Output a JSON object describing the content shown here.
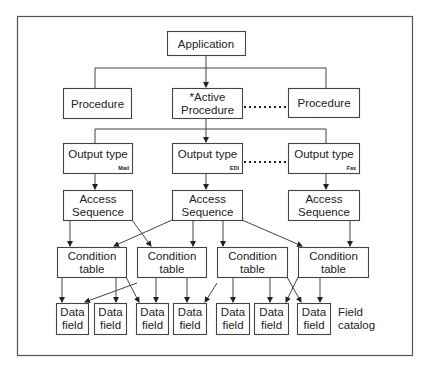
{
  "diagram": {
    "application": "Application",
    "procedures": [
      {
        "lines": [
          "Procedure"
        ]
      },
      {
        "lines": [
          "*Active",
          "Procedure"
        ]
      },
      {
        "lines": [
          "Procedure"
        ]
      }
    ],
    "output_types": [
      {
        "label": "Output type",
        "medium": "Mail"
      },
      {
        "label": "Output type",
        "medium": "EDI"
      },
      {
        "label": "Output type",
        "medium": "Fax"
      }
    ],
    "access_sequences": [
      {
        "lines": [
          "Access",
          "Sequence"
        ]
      },
      {
        "lines": [
          "Access",
          "Sequence"
        ]
      },
      {
        "lines": [
          "Access",
          "Sequence"
        ]
      }
    ],
    "condition_tables": [
      {
        "lines": [
          "Condition",
          "table"
        ]
      },
      {
        "lines": [
          "Condition",
          "table"
        ]
      },
      {
        "lines": [
          "Condition",
          "table"
        ]
      },
      {
        "lines": [
          "Condition",
          "table"
        ]
      }
    ],
    "data_fields": [
      {
        "lines": [
          "Data",
          "field"
        ]
      },
      {
        "lines": [
          "Data",
          "field"
        ]
      },
      {
        "lines": [
          "Data",
          "field"
        ]
      },
      {
        "lines": [
          "Data",
          "field"
        ]
      },
      {
        "lines": [
          "Data",
          "field"
        ]
      },
      {
        "lines": [
          "Data",
          "field"
        ]
      },
      {
        "lines": [
          "Data",
          "field"
        ]
      }
    ],
    "field_catalog": [
      "Field",
      "catalog"
    ]
  }
}
